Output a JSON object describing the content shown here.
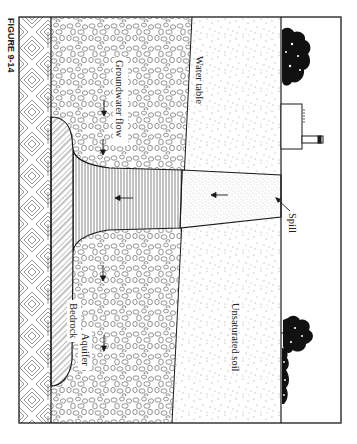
{
  "figure": {
    "caption_label": "FIGURE 9-14",
    "orientation": "rotated 90 degrees clockwise",
    "colors": {
      "line": "#1a1a1a",
      "background": "#ffffff",
      "hatch": "#555555",
      "stipple": "#777777"
    }
  },
  "labels": {
    "water_table": "Water table",
    "groundwater_flow": "Groundwater flow",
    "bedrock": "Bedrock",
    "aquifer": "Aquifer",
    "unsaturated_soil": "Unsaturated soil",
    "spill": "Spill"
  },
  "layers": [
    {
      "name": "Bedrock",
      "pattern": "diagonal-crosshatch"
    },
    {
      "name": "Aquifer",
      "pattern": "pebbles"
    },
    {
      "name": "Unsaturated soil",
      "pattern": "stipple"
    },
    {
      "name": "Contaminant plume (saturated)",
      "pattern": "vertical-lines"
    },
    {
      "name": "Contaminant column (unsaturated)",
      "pattern": "fine-stipple"
    },
    {
      "name": "Dense pooled layer",
      "pattern": "wavy-diagonal"
    }
  ],
  "surface_features": [
    "tree",
    "factory",
    "tree",
    "shrub"
  ]
}
